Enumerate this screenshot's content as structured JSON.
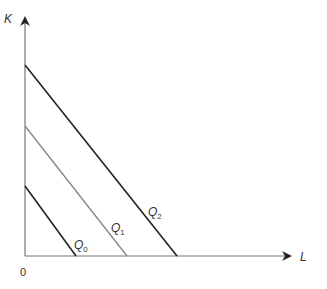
{
  "diagram": {
    "type": "isoquant-map",
    "axes": {
      "y_label": "K",
      "x_label": "L",
      "origin_label": "0"
    },
    "curves": [
      {
        "id": "Q0",
        "label": "Q",
        "subscript": "0",
        "color": "#222222",
        "x1": 25,
        "y1": 186,
        "x2": 76,
        "y2": 256
      },
      {
        "id": "Q1",
        "label": "Q",
        "subscript": "1",
        "color": "#888888",
        "x1": 25,
        "y1": 126,
        "x2": 127,
        "y2": 256
      },
      {
        "id": "Q2",
        "label": "Q",
        "subscript": "2",
        "color": "#222222",
        "x1": 25,
        "y1": 65,
        "x2": 177,
        "y2": 256
      }
    ]
  }
}
